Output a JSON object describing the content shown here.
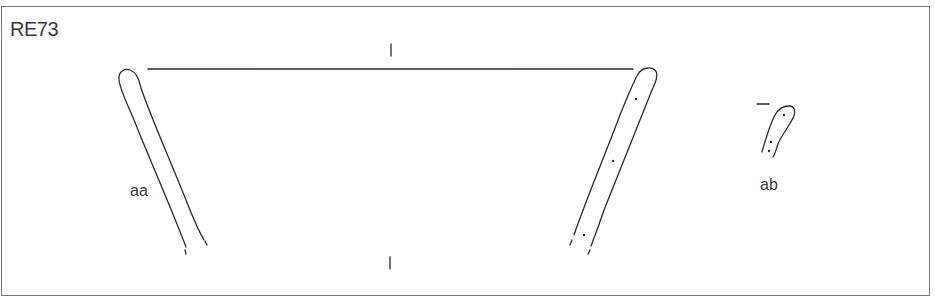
{
  "sheet": {
    "id_label": "RE73"
  },
  "figures": [
    {
      "key": "aa",
      "label": "aa",
      "description": "Vessel profile with rim diameter line and axis ticks"
    },
    {
      "key": "ab",
      "label": "ab",
      "description": "Small rim fragment profile"
    }
  ],
  "colors": {
    "line": "#2a2a2a",
    "frame": "#7a7a7a",
    "text": "#3a3a3a",
    "background": "#ffffff"
  }
}
